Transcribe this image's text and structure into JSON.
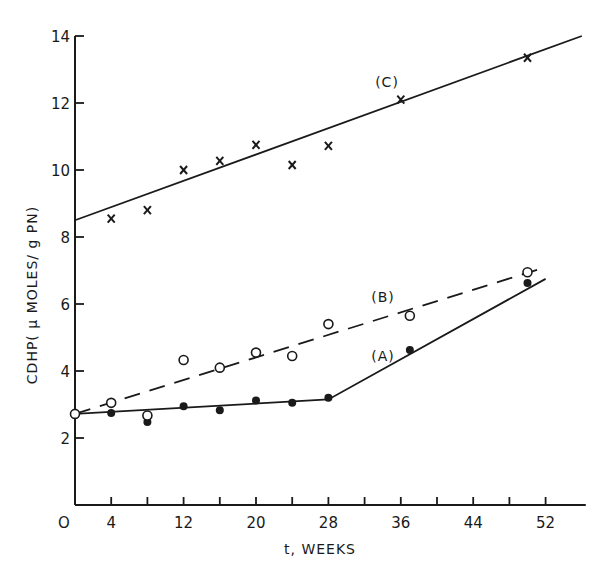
{
  "chart_data": {
    "type": "line",
    "title": "",
    "xlabel": "t, WEEKS",
    "ylabel": "CDHP(μMOLES/gPN)",
    "xlim": [
      0,
      56
    ],
    "ylim": [
      0,
      14
    ],
    "x_ticks": [
      0,
      4,
      12,
      20,
      28,
      36,
      44,
      52
    ],
    "x_tick_labels": [
      "O",
      "4",
      "12",
      "20",
      "28",
      "36",
      "44",
      "52"
    ],
    "x_minor_ticks": [
      4,
      8,
      12,
      16,
      20,
      24,
      28,
      32,
      36,
      40,
      44,
      48,
      52
    ],
    "y_ticks": [
      2,
      4,
      6,
      8,
      10,
      12,
      14
    ],
    "y_tick_labels": [
      "2",
      "4",
      "6",
      "8",
      "10",
      "12",
      "14"
    ],
    "grid": false,
    "legend": "inline labels (A), (B), (C)",
    "series": [
      {
        "name": "(A)",
        "marker": "filled-circle",
        "line_style": "solid, piecewise",
        "x": [
          0,
          4,
          8,
          12,
          16,
          20,
          24,
          28,
          37,
          50
        ],
        "y": [
          2.72,
          2.75,
          2.48,
          2.95,
          2.83,
          3.12,
          3.05,
          3.2,
          4.63,
          6.63
        ],
        "fit_line": [
          [
            0,
            2.72
          ],
          [
            28,
            3.15
          ],
          [
            52,
            6.75
          ]
        ]
      },
      {
        "name": "(B)",
        "marker": "open-circle",
        "line_style": "dashed",
        "x": [
          0,
          4,
          8,
          12,
          16,
          20,
          24,
          28,
          37,
          50
        ],
        "y": [
          2.72,
          3.05,
          2.67,
          4.33,
          4.1,
          4.55,
          4.45,
          5.4,
          5.65,
          6.95
        ],
        "fit_line": [
          [
            0,
            2.72
          ],
          [
            52,
            7.1
          ]
        ]
      },
      {
        "name": "(C)",
        "marker": "x",
        "line_style": "solid",
        "x": [
          4,
          8,
          12,
          16,
          20,
          24,
          28,
          36,
          50
        ],
        "y": [
          8.55,
          8.8,
          10.0,
          10.27,
          10.75,
          10.15,
          10.72,
          12.1,
          13.35
        ],
        "fit_line": [
          [
            0,
            8.5
          ],
          [
            56,
            14.0
          ]
        ]
      }
    ]
  },
  "labels": {
    "xlabel": "t, WEEKS",
    "ylabel": "CDHP( μ MOLES/ g PN)",
    "seriesA": "(A)",
    "seriesB": "(B)",
    "seriesC": "(C)"
  }
}
